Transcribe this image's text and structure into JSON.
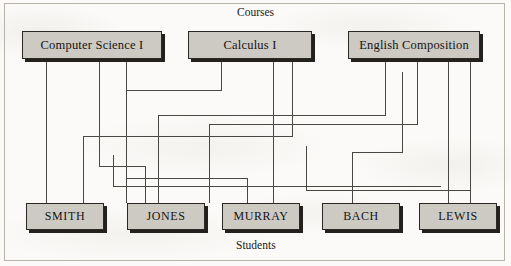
{
  "figure": {
    "top_caption": "Courses",
    "bottom_caption": "Students",
    "colors": {
      "node_fill": "#cdcac4",
      "node_border": "#2a2724",
      "node_shadow": "#23211e",
      "wire": "#4a4843",
      "frame": "#b9b4aa",
      "paper": "#fbfaf8"
    }
  },
  "courses": [
    {
      "id": "cs1",
      "label": "Computer Science I",
      "x": 22,
      "y": 31,
      "w": 140
    },
    {
      "id": "calc1",
      "label": "Calculus I",
      "x": 188,
      "y": 31,
      "w": 124
    },
    {
      "id": "engcomp",
      "label": "English Composition",
      "x": 348,
      "y": 31,
      "w": 132
    }
  ],
  "students": [
    {
      "id": "smith",
      "label": "SMITH",
      "x": 26,
      "y": 203,
      "w": 78
    },
    {
      "id": "jones",
      "label": "JONES",
      "x": 127,
      "y": 203,
      "w": 78
    },
    {
      "id": "murray",
      "label": "MURRAY",
      "x": 222,
      "y": 203,
      "w": 78
    },
    {
      "id": "bach",
      "label": "BACH",
      "x": 322,
      "y": 203,
      "w": 78
    },
    {
      "id": "lewis",
      "label": "LEWIS",
      "x": 419,
      "y": 203,
      "w": 78
    }
  ],
  "connections": [
    {
      "from": "cs1",
      "to": "smith",
      "points": "46,60 46,203"
    },
    {
      "from": "cs1",
      "to": "jones",
      "points": "99,60 99,166 145,166 145,203"
    },
    {
      "from": "cs1",
      "to": "murray",
      "points": "126,60 126,178 247,178 247,203"
    },
    {
      "from": "calc1",
      "to": "jones",
      "points": "221,60 221,90 126,90 126,203"
    },
    {
      "from": "calc1",
      "to": "murray",
      "points": "273,60 273,203"
    },
    {
      "from": "calc1",
      "to": "smith",
      "points": "292,60 292,136 83,136 83,203"
    },
    {
      "from": "engcomp",
      "to": "murray",
      "points": "385,60 385,115 158,115 158,203"
    },
    {
      "from": "engcomp",
      "to": "bach",
      "points": "417,60 417,124 209,124 209,203"
    },
    {
      "from": "engcomp",
      "to": "bach",
      "points": "448,60 448,203"
    },
    {
      "from": "engcomp",
      "to": "lewis",
      "points": "470,60 470,203"
    },
    {
      "from": "engcomp",
      "to": "bach",
      "points": "402,72 402,152 352,152 352,203"
    },
    {
      "from": "calc1",
      "to": "lewis",
      "points": "306,146 306,190 470,190"
    },
    {
      "from": "cs1",
      "to": "lewis",
      "points": "113,155 113,186 441,186"
    }
  ]
}
